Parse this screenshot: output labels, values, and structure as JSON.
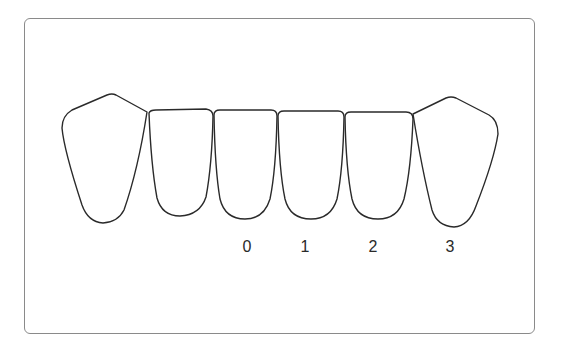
{
  "diagram": {
    "teeth_count": 6,
    "labels": [
      {
        "text": "0",
        "tooth_index": 2
      },
      {
        "text": "1",
        "tooth_index": 3
      },
      {
        "text": "2",
        "tooth_index": 4
      },
      {
        "text": "3",
        "tooth_index": 5
      }
    ],
    "colors": {
      "outline": "#2a2a2a",
      "frame_border": "#8a8a8a",
      "background": "#ffffff"
    }
  }
}
